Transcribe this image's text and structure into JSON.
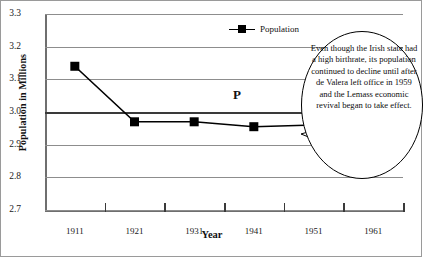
{
  "chart_data": {
    "type": "line",
    "title": "",
    "xlabel": "Year",
    "ylabel": "Population in Millions",
    "categories": [
      "1911",
      "1921",
      "1931",
      "1941",
      "1951",
      "1961"
    ],
    "series": [
      {
        "name": "Population",
        "values": [
          3.14,
          2.97,
          2.97,
          2.955,
          2.96,
          2.82
        ]
      }
    ],
    "ylim": [
      2.7,
      3.3
    ],
    "yticks": [
      "2.7",
      "2.8",
      "2.9",
      "3.0",
      "3.1",
      "3.2",
      "3.3"
    ],
    "grid": true,
    "legend_position": "top-right",
    "emphasis_gridline": "3.0",
    "marker": "filled-square",
    "annotations": [
      {
        "name": "point-label",
        "text": "P"
      },
      {
        "name": "callout",
        "text": "Even though the Irish state had a high birthrate, its population continued to decline until after de Valera left office in 1959 and the Lemass economic revival began to take effect."
      }
    ]
  },
  "legend": {
    "entries": [
      {
        "label": "Population"
      }
    ]
  },
  "axes": {
    "y_title": "Population in Millions",
    "x_title": "Year"
  }
}
